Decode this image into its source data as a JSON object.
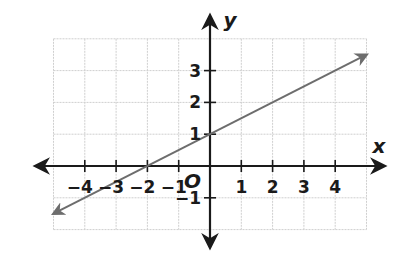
{
  "chart_data": {
    "type": "line",
    "title": "",
    "xlabel": "x",
    "ylabel": "y",
    "origin_label": "O",
    "xlim": [
      -5,
      5
    ],
    "ylim": [
      -2,
      4
    ],
    "grid": true,
    "x_ticks": [
      -4,
      -3,
      -2,
      -1,
      1,
      2,
      3,
      4
    ],
    "x_tick_labels": [
      "−4",
      "−3",
      "−2",
      "−1",
      "1",
      "2",
      "3",
      "4"
    ],
    "y_ticks": [
      -1,
      1,
      2,
      3
    ],
    "y_tick_labels": [
      "−1",
      "1",
      "2",
      "3"
    ],
    "series": [
      {
        "name": "line",
        "equation": "y = 0.5x + 1",
        "x": [
          -5,
          -4,
          -3,
          -2,
          -1,
          0,
          1,
          2,
          3,
          4,
          5
        ],
        "y": [
          -1.5,
          -1,
          -0.5,
          0,
          0.5,
          1,
          1.5,
          2,
          2.5,
          3,
          3.5
        ],
        "arrows_both_ends": true,
        "color": "#6d6d6d"
      }
    ],
    "colors": {
      "axis": "#1a1a1a",
      "grid": "#cfcfcf",
      "line": "#6d6d6d"
    }
  }
}
